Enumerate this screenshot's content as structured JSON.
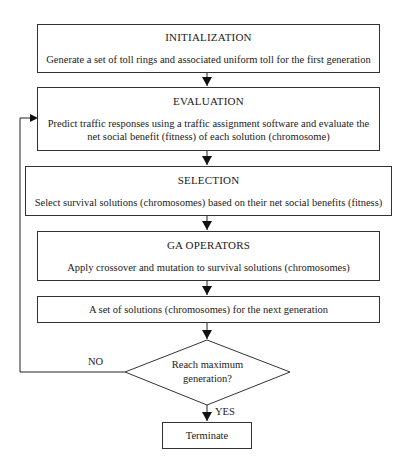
{
  "diagram": {
    "type": "flowchart",
    "steps": [
      {
        "id": "initialization",
        "title": "INITIALIZATION",
        "description": "Generate a set of toll rings and associated uniform toll for the first generation"
      },
      {
        "id": "evaluation",
        "title": "EVALUATION",
        "description_lines": [
          "Predict traffic responses using a traffic assignment software and evaluate the",
          "net social benefit (fitness) of each solution (chromosome)"
        ]
      },
      {
        "id": "selection",
        "title": "SELECTION",
        "description": "Select survival solutions (chromosomes) based on their net social benefits (fitness)"
      },
      {
        "id": "ga_operators",
        "title": "GA OPERATORS",
        "description": "Apply crossover and mutation to survival solutions (chromosomes)"
      },
      {
        "id": "next_generation",
        "description": "A set of solutions (chromosomes) for the next generation"
      }
    ],
    "decision": {
      "lines": [
        "Reach maximum",
        "generation?"
      ],
      "no_label": "NO",
      "yes_label": "YES"
    },
    "terminal": {
      "label": "Terminate"
    }
  }
}
